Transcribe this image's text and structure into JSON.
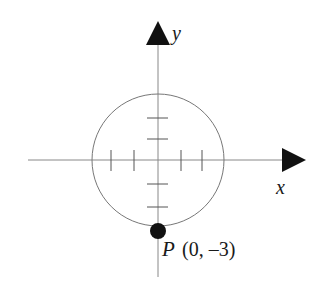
{
  "diagram": {
    "type": "coordinate-circle",
    "axes": {
      "x_label": "x",
      "y_label": "y"
    },
    "circle": {
      "center": [
        0,
        0
      ],
      "radius": 3
    },
    "ticks": {
      "x": [
        -2,
        -1,
        1,
        2
      ],
      "y": [
        -2,
        -1,
        1,
        2
      ]
    },
    "point": {
      "name": "P",
      "coords_label": "(0, –3)",
      "x": 0,
      "y": -3
    },
    "colors": {
      "stroke": "#777777",
      "axis": "#888888",
      "fill": "#111111"
    }
  }
}
